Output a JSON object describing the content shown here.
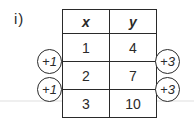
{
  "label": "i)",
  "table": {
    "headers": [
      "x",
      "y"
    ],
    "rows": [
      [
        "1",
        "4"
      ],
      [
        "2",
        "7"
      ],
      [
        "3",
        "10"
      ]
    ]
  },
  "annotations": {
    "left": [
      "+1",
      "+1"
    ],
    "right": [
      "+3",
      "+3"
    ]
  }
}
